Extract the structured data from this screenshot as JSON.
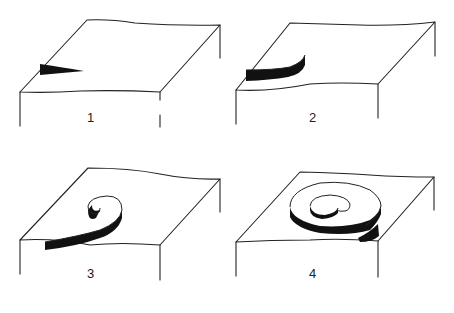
{
  "figure": {
    "panels": [
      {
        "id": 1,
        "label": "1",
        "label_pos": [
          87,
          117
        ]
      },
      {
        "id": 2,
        "label": "2",
        "label_pos": [
          309,
          117
        ]
      },
      {
        "id": 3,
        "label": "3",
        "label_pos": [
          87,
          272
        ]
      },
      {
        "id": 4,
        "label": "4",
        "label_pos": [
          309,
          272
        ]
      }
    ],
    "colors": {
      "line": "#222222",
      "fill": "#111111",
      "background": "#ffffff"
    }
  }
}
